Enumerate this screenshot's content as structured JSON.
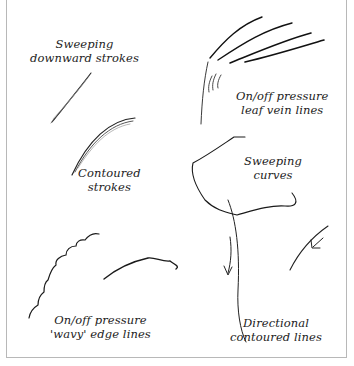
{
  "illustration": {
    "subject": "Pen stroke technique examples",
    "labels": [
      {
        "id": "sweeping-downward",
        "lines": [
          "Sweeping",
          "downward strokes"
        ]
      },
      {
        "id": "leaf-vein",
        "lines": [
          "On/off pressure",
          "leaf vein lines"
        ]
      },
      {
        "id": "contoured",
        "lines": [
          "Contoured",
          "strokes"
        ]
      },
      {
        "id": "sweeping-curves",
        "lines": [
          "Sweeping",
          "curves"
        ]
      },
      {
        "id": "wavy-edge",
        "lines": [
          "On/off pressure",
          "'wavy' edge lines"
        ]
      },
      {
        "id": "directional",
        "lines": [
          "Directional",
          "contoured lines"
        ]
      }
    ],
    "colors": {
      "ink": "#1a1a1a",
      "frame": "#b8b8b8",
      "background": "#ffffff"
    }
  }
}
